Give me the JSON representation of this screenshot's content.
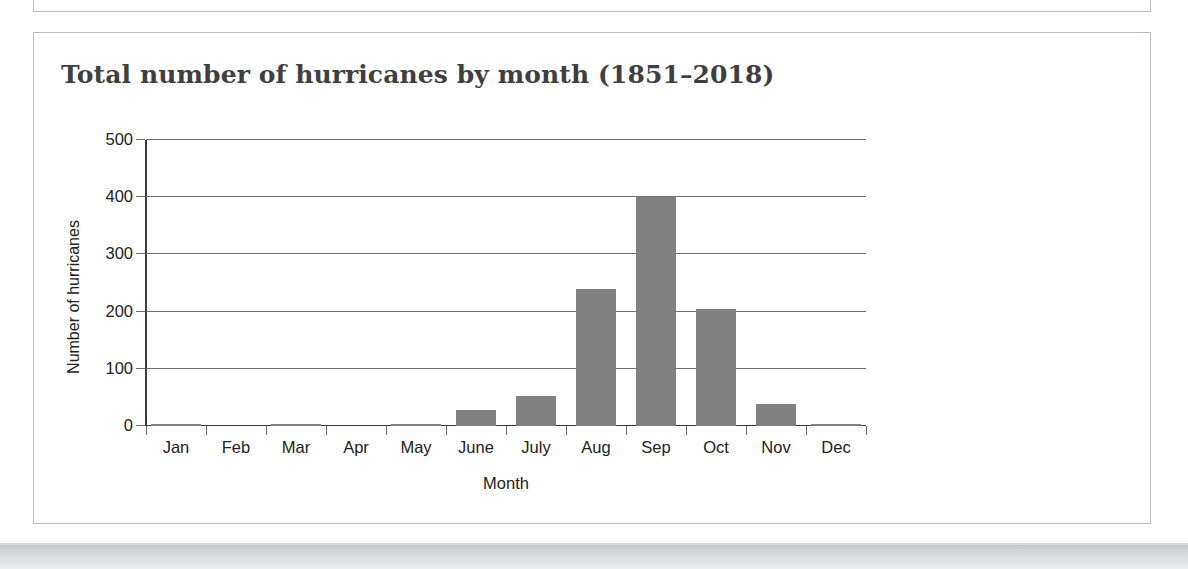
{
  "page": {
    "background_color": "#ffffff",
    "card_border_color": "#b9bcc0"
  },
  "figure": {
    "title": "Total number of hurricanes by month (1851–2018)"
  },
  "chart_data": {
    "type": "bar",
    "title": "Total number of hurricanes by month (1851–2018)",
    "xlabel": "Month",
    "ylabel": "Number of hurricanes",
    "categories": [
      "Jan",
      "Feb",
      "Mar",
      "Apr",
      "May",
      "June",
      "July",
      "Aug",
      "Sep",
      "Oct",
      "Nov",
      "Dec"
    ],
    "values": [
      3,
      0,
      1,
      0,
      3,
      28,
      53,
      240,
      400,
      205,
      38,
      3
    ],
    "ylim": [
      0,
      500
    ],
    "ytick_labels": [
      "500",
      "400",
      "300",
      "200",
      "100",
      "0"
    ],
    "ytick_values": [
      500,
      400,
      300,
      200,
      100,
      0
    ],
    "grid": "horizontal",
    "legend": "none",
    "bar_color": "#808080",
    "axis_color": "#3c3c3c",
    "gridline_color": "#6d6e70"
  }
}
